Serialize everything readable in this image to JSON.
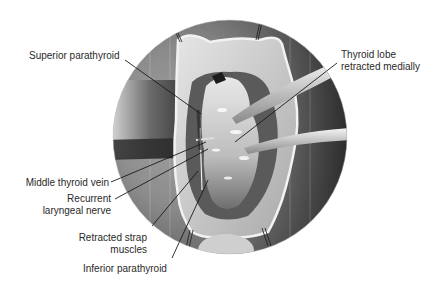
{
  "figure": {
    "labels": {
      "superior_parathyroid": "Superior parathyroid",
      "thyroid_lobe_line1": "Thyroid lobe",
      "thyroid_lobe_line2": "retracted medially",
      "middle_thyroid_vein": "Middle thyroid vein",
      "recurrent_line1": "Recurrent",
      "recurrent_line2": "laryngeal nerve",
      "strap_line1": "Retracted strap",
      "strap_line2": "muscles",
      "inferior_parathyroid": "Inferior parathyroid"
    },
    "colors": {
      "background": "#ffffff",
      "field_dark": "#3a3a3a",
      "field_mid": "#8c8c8c",
      "tissue_light": "#d8d8d8",
      "leader_line": "#1a1a1a",
      "text": "#2a2a2a"
    }
  }
}
